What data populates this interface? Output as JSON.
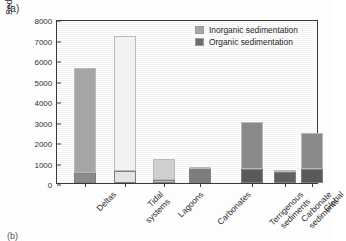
{
  "figure": {
    "panel_label": "(a)",
    "next_panel_label": "(b)"
  },
  "legend": {
    "position": "top-right",
    "items": [
      {
        "label": "Inorganic sedimentation",
        "color": "#a8a8a8"
      },
      {
        "label": "Organic sedimentation",
        "color": "#6e6e6e"
      }
    ]
  },
  "chart_data": {
    "type": "bar",
    "stacked": true,
    "title": "",
    "xlabel": "",
    "ylabel": "Sedimentation (g m⁻² yr⁻¹)",
    "ylabel_text": "Sedimentation (g m",
    "ylabel_sup1": "-2",
    "ylabel_mid": " yr",
    "ylabel_sup2": "-1",
    "ylabel_end": ")",
    "ylim": [
      0,
      8000
    ],
    "yticks": [
      0,
      1000,
      2000,
      3000,
      4000,
      5000,
      6000,
      7000,
      8000
    ],
    "ytick_labels": [
      "0",
      "1000",
      "2000",
      "3000",
      "4000",
      "5000",
      "6000",
      "7000",
      "8000"
    ],
    "grid": false,
    "categories": [
      "Deltas",
      "Tidal systems",
      "Lagoons",
      "Carbonates",
      "Terrigenous sediments",
      "Carbonate sediments",
      "Global"
    ],
    "category_lines": [
      [
        "Deltas"
      ],
      [
        "Tidal",
        "systems"
      ],
      [
        "Lagoons"
      ],
      [
        "Carbonates"
      ],
      [
        "Terrigenous",
        "sediments"
      ],
      [
        "Carbonate",
        "sediments"
      ],
      [
        "Global"
      ]
    ],
    "series": [
      {
        "name": "Organic sedimentation",
        "values": [
          500,
          600,
          140,
          700,
          700,
          550,
          700
        ]
      },
      {
        "name": "Inorganic sedimentation",
        "values": [
          5100,
          6550,
          1010,
          100,
          2300,
          50,
          1750
        ]
      }
    ],
    "totals": [
      5600,
      7150,
      1150,
      800,
      3000,
      600,
      2450
    ],
    "bar_styles": [
      {
        "inorganic": "#a5a5a5",
        "organic": "#8c8c8c"
      },
      {
        "inorganic": "#f2f2f2",
        "organic": "#e4e4e4"
      },
      {
        "inorganic": "#cfcfcf",
        "organic": "#c2c2c2"
      },
      {
        "inorganic": "#8f8f8f",
        "organic": "#7d7d7d"
      },
      {
        "inorganic": "#8a8a8a",
        "organic": "#5a5a5a"
      },
      {
        "inorganic": "#8a8a8a",
        "organic": "#5f5f5f"
      },
      {
        "inorganic": "#8a8a8a",
        "organic": "#5a5a5a"
      }
    ],
    "bar_positions_pct": [
      10.5,
      26.0,
      41.0,
      54.5,
      74.5,
      87.0,
      97.5
    ],
    "bar_width_px": 22,
    "gap_after_index": 3
  }
}
